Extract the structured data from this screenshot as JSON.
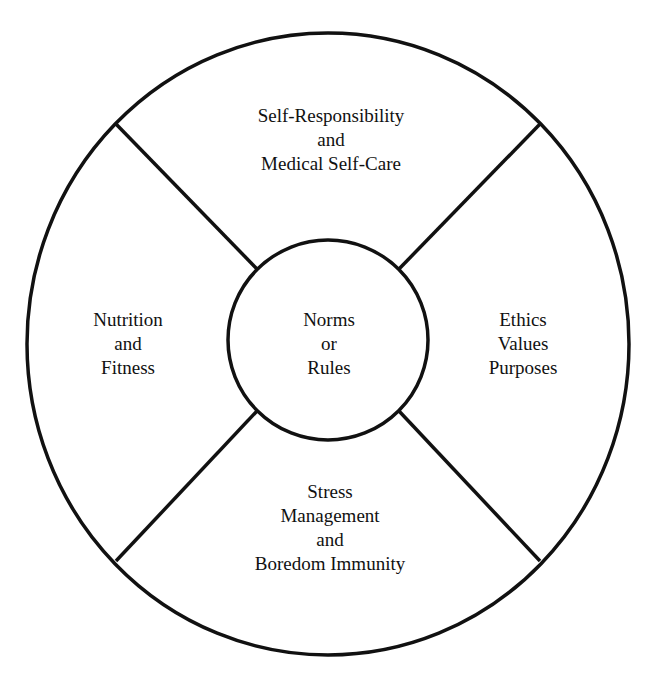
{
  "diagram": {
    "type": "wheel",
    "stroke_color": "#111111",
    "background_color": "#ffffff",
    "center": {
      "lines": [
        "Norms",
        "or",
        "Rules"
      ]
    },
    "segments": [
      {
        "position": "top",
        "lines": [
          "Self-Responsibility",
          "and",
          "Medical Self-Care"
        ]
      },
      {
        "position": "left",
        "lines": [
          "Nutrition",
          "and",
          "Fitness"
        ]
      },
      {
        "position": "right",
        "lines": [
          "Ethics",
          "Values",
          "Purposes"
        ]
      },
      {
        "position": "bottom",
        "lines": [
          "Stress",
          "Management",
          "and",
          "Boredom Immunity"
        ]
      }
    ]
  }
}
